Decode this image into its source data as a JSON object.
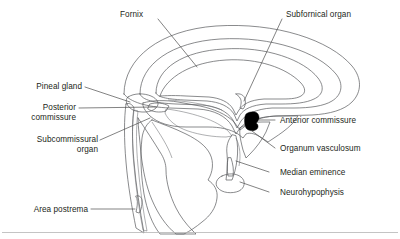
{
  "figure": {
    "background_color": "#ffffff",
    "text_color": "#231f20",
    "leader_color": "#4d4d4d",
    "outline_color": "#58595b",
    "fills": {
      "pale": "#efefef",
      "light": "#e2e2e2",
      "mid": "#cfcfcf",
      "dark": "#bdbdbd",
      "deep": "#ababab",
      "black": "#000000"
    }
  },
  "labels": {
    "fornix": "Fornix",
    "subfornical_organ": "Subfornical organ",
    "pineal_gland": "Pineal gland",
    "posterior_commissure_line1": "Posterior",
    "posterior_commissure_line2": "commissure",
    "subcommissural_organ_line1": "Subcommissural",
    "subcommissural_organ_line2": "organ",
    "anterior_commissure": "Anterior commissure",
    "organum_vasculosum": "Organum vasculosum",
    "median_eminence": "Median eminence",
    "neurohypophysis": "Neurohypophysis",
    "area_postrema": "Area postrema"
  }
}
